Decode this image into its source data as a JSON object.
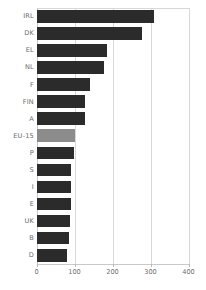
{
  "chart_data": {
    "type": "bar",
    "orientation": "horizontal",
    "title": "",
    "subtitle": "",
    "xlabel": "",
    "ylabel": "",
    "categories": [
      "IRL",
      "DK",
      "EL",
      "NL",
      "F",
      "FIN",
      "A",
      "EU-15",
      "P",
      "S",
      "I",
      "E",
      "UK",
      "B",
      "D"
    ],
    "values": [
      310,
      277,
      185,
      178,
      141,
      128,
      128,
      100,
      99,
      92,
      92,
      91,
      87,
      85,
      80
    ],
    "xlim": [
      0,
      400
    ],
    "xticks": [
      0,
      100,
      200,
      300,
      400
    ],
    "xtick_labels": [
      "0",
      "100",
      "200",
      "300",
      "400"
    ],
    "grid": "vertical",
    "legend": "none",
    "highlight_category": "EU-15",
    "bar_color": "#2b2b2b",
    "highlight_color": "#8c8c8c",
    "gridline_color": "#d8d8d8",
    "axis_color": "#c9c9c9",
    "label_color": "#6d6d6d",
    "background_color": "#ffffff"
  }
}
